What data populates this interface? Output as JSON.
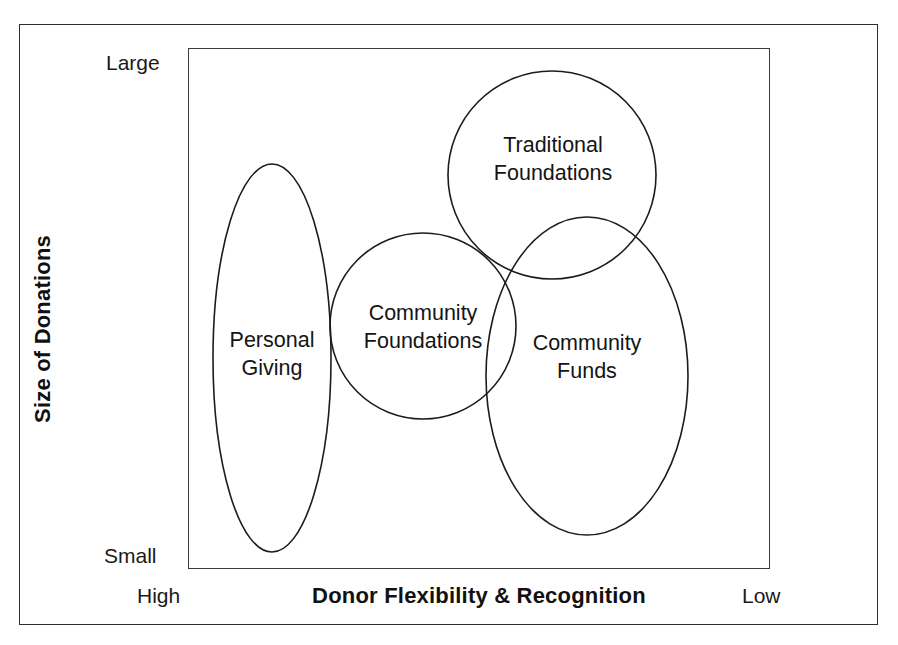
{
  "figure": {
    "background_color": "#ffffff",
    "line_color": "#1c1c1c"
  },
  "axes": {
    "y_title": "Size of Donations",
    "y_ticks": {
      "top": "Large",
      "bottom": "Small"
    },
    "x_title": "Donor Flexibility & Recognition",
    "x_ticks": {
      "left": "High",
      "right": "Low"
    }
  },
  "chart_data": {
    "type": "scatter",
    "title": "",
    "subtitle": "",
    "xlabel": "Donor Flexibility & Recognition",
    "ylabel": "Size of Donations",
    "xlim": [
      "High",
      "Low"
    ],
    "ylim": [
      "Small",
      "Large"
    ],
    "grid": false,
    "legend": "none",
    "note": "Conceptual positioning diagram: four overlapping Venn-style regions placed on a qualitative 2-axis grid.",
    "regions": [
      {
        "label": "Personal\nGiving",
        "label_line1": "Personal",
        "label_line2": "Giving",
        "shape": "ellipse",
        "cx": 272,
        "cy": 358,
        "rx": 59,
        "ry": 194,
        "donor_flexibility": "High",
        "size_of_donations": "Small to Large (widest vertical span)"
      },
      {
        "label": "Community\nFoundations",
        "label_line1": "Community",
        "label_line2": "Foundations",
        "shape": "circle",
        "cx": 423,
        "cy": 326,
        "rx": 93,
        "ry": 93,
        "donor_flexibility": "Medium-High",
        "size_of_donations": "Medium"
      },
      {
        "label": "Traditional\nFoundations",
        "label_line1": "Traditional",
        "label_line2": "Foundations",
        "shape": "circle",
        "cx": 552,
        "cy": 175,
        "rx": 104,
        "ry": 104,
        "donor_flexibility": "Medium-Low",
        "size_of_donations": "Large"
      },
      {
        "label": "Community\nFunds",
        "label_line1": "Community",
        "label_line2": "Funds",
        "shape": "ellipse",
        "cx": 587,
        "cy": 376,
        "rx": 101,
        "ry": 159,
        "donor_flexibility": "Low",
        "size_of_donations": "Small to Large"
      }
    ]
  }
}
